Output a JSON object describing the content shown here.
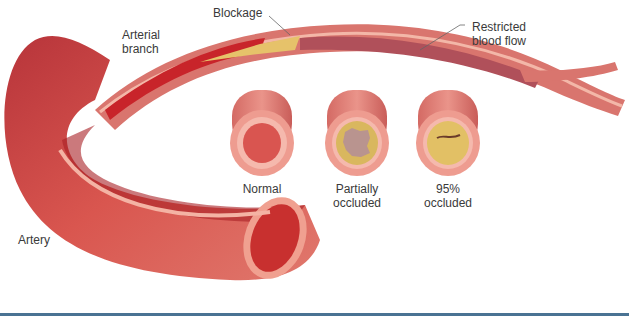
{
  "diagram": {
    "labels": {
      "arterial_branch": [
        "Arterial",
        "branch"
      ],
      "blockage": "Blockage",
      "restricted_flow": [
        "Restricted",
        "blood flow"
      ],
      "artery": "Artery"
    },
    "cross_sections": [
      {
        "id": "normal",
        "label_lines": [
          "Normal"
        ],
        "occlusion": "none"
      },
      {
        "id": "partial",
        "label_lines": [
          "Partially",
          "occluded"
        ],
        "occlusion": "partial"
      },
      {
        "id": "severe",
        "label_lines": [
          "95%",
          "occluded"
        ],
        "occlusion": "95%"
      }
    ],
    "colors": {
      "vessel_wall": "#d9756e",
      "vessel_outer": "#e8938a",
      "vessel_edge": "#f3b7a8",
      "blood": "#c8242a",
      "blood_dark": "#a31b22",
      "plaque": "#e6c26a",
      "plaque_light": "#efd48a",
      "restricted": "#b0505a",
      "rule": "#4a7393"
    }
  }
}
